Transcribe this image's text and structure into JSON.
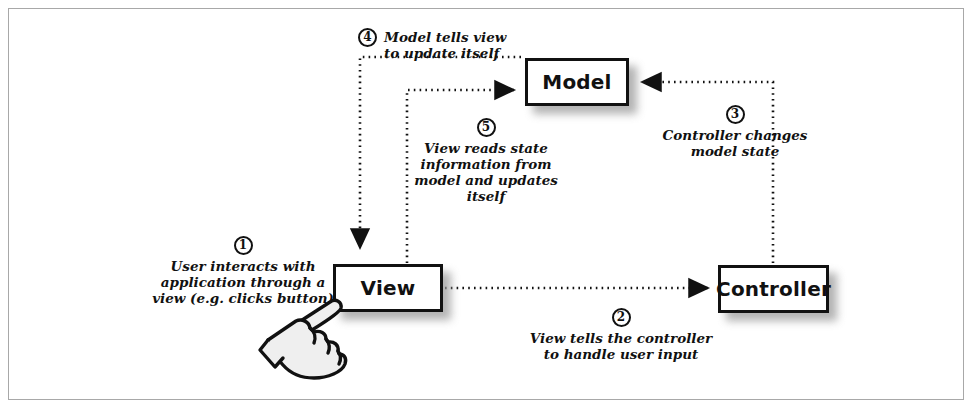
{
  "diagram": {
    "type": "flow-diagram",
    "frame_border_color": "#a8a8a8",
    "ink_color": "#111111",
    "background_color": "#ffffff",
    "nodes": [
      {
        "id": "model",
        "label": "Model",
        "x": 525,
        "y": 58,
        "w": 104,
        "h": 48
      },
      {
        "id": "view",
        "label": "View",
        "x": 333,
        "y": 264,
        "w": 110,
        "h": 48
      },
      {
        "id": "controller",
        "label": "Controller",
        "x": 718,
        "y": 265,
        "w": 111,
        "h": 48
      }
    ],
    "steps": [
      {
        "number": "1",
        "caption": "User interacts with\napplication through a\nview (e.g. clicks button)",
        "from": "user",
        "to": "view",
        "arrow": false
      },
      {
        "number": "2",
        "caption": "View tells the controller\nto handle user input",
        "from": "view",
        "to": "controller",
        "arrow": true
      },
      {
        "number": "3",
        "caption": "Controller changes\nmodel state",
        "from": "controller",
        "to": "model",
        "arrow": true
      },
      {
        "number": "4",
        "caption": "Model tells view\nto update itself",
        "from": "model",
        "to": "view",
        "arrow": true
      },
      {
        "number": "5",
        "caption": "View reads state\ninformation from\nmodel and updates\nitself",
        "from": "view",
        "to": "model",
        "arrow": true
      }
    ],
    "icons": {
      "hand_cursor": "pointing-hand-cursor"
    },
    "connector_style": {
      "stroke": "#111111",
      "dash": "dotted",
      "width": 2.6
    }
  }
}
